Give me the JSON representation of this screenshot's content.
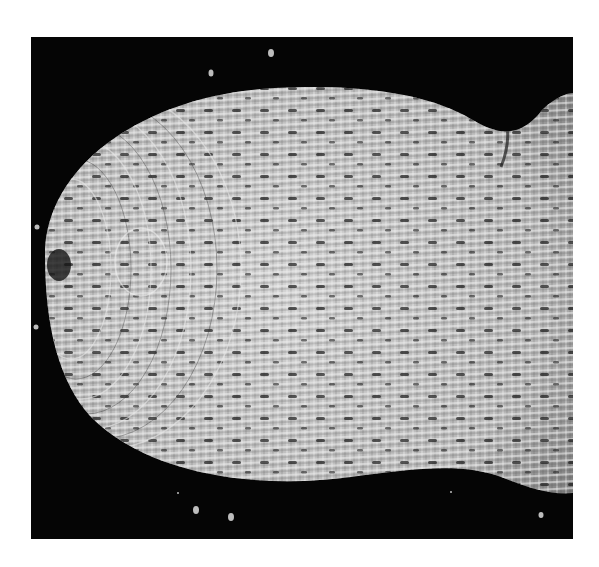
{
  "image": {
    "subject": "woven fibrous basket-like structure",
    "tone": "grayscale",
    "background_color": "#050505",
    "frame_color": "#ffffff",
    "object_color": "#c8c8c8",
    "fiber_highlight": "#ececec",
    "fiber_shadow": "#3a3a3a"
  }
}
